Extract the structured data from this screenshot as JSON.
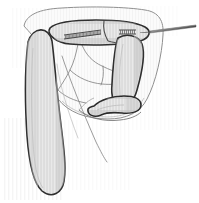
{
  "figure": {
    "domain": "Diagram",
    "canvas": {
      "width": 199,
      "height": 203
    },
    "colors": {
      "background": "#ffffff",
      "organ_fill": "#dcdcdc",
      "organ_fill_light": "#e8e8e8",
      "serosa_fill": "#fbfbfb",
      "outline_dark": "#2b2b2b",
      "outline_mid": "#555555",
      "outline_light": "#9a9a9a",
      "hatch_line": "#efefef",
      "needle_fill": "#6e6e6e",
      "staple_line": "#3a3a3a"
    },
    "stroke_widths": {
      "outer_contour": 1.0,
      "bowel_outline": 1.6,
      "internal_fold": 0.8,
      "staple_tick": 0.6
    },
    "elements": [
      {
        "name": "outer-peritoneal-contour",
        "kind": "outline",
        "label": "outer serosal envelope"
      },
      {
        "name": "transverse-bowel-segment",
        "kind": "organ",
        "label": "transverse segment"
      },
      {
        "name": "descending-left-limb",
        "kind": "organ",
        "label": "long left limb"
      },
      {
        "name": "descending-right-limb",
        "kind": "organ",
        "label": "right limb"
      },
      {
        "name": "hooked-distal-loop",
        "kind": "organ",
        "label": "hooked distal loop"
      },
      {
        "name": "staple-line-primary",
        "kind": "annotation",
        "label": "primary staple line"
      },
      {
        "name": "staple-line-secondary",
        "kind": "annotation",
        "label": "secondary staple line"
      },
      {
        "name": "needle-instrument",
        "kind": "instrument",
        "label": "needle"
      },
      {
        "name": "mesentery-folds",
        "kind": "outline",
        "label": "mesenteric fold lines"
      },
      {
        "name": "background-striations",
        "kind": "texture",
        "label": "vertical striation texture"
      }
    ],
    "counts": {
      "staple_lines": 2,
      "primary_staple_ticks": 26,
      "secondary_staple_ticks": 8,
      "bowel_limbs": 3
    }
  }
}
